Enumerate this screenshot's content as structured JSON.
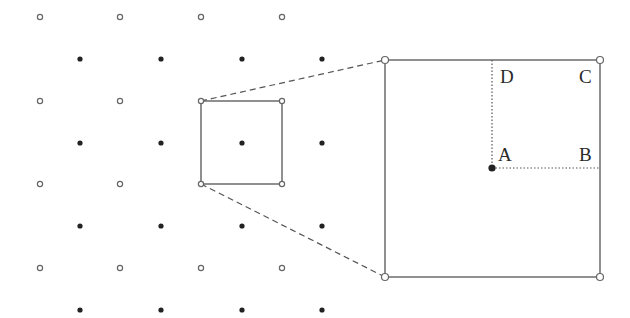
{
  "figure": {
    "colors": {
      "line": "#555555",
      "open_point_stroke": "#666666",
      "filled_point": "#222222",
      "text": "#2a2a2a",
      "background": "#ffffff"
    }
  },
  "lattice": {
    "open_points": {
      "xs": [
        40,
        120,
        201,
        282
      ],
      "ys": [
        17,
        101,
        184,
        268
      ]
    },
    "filled_points": {
      "xs": [
        80,
        161,
        242,
        322
      ],
      "ys": [
        59,
        143,
        226,
        310
      ]
    }
  },
  "small_square": {
    "x1": 201,
    "y1": 101,
    "x2": 282,
    "y2": 184
  },
  "big_square": {
    "x1": 385,
    "y1": 60,
    "x2": 600,
    "y2": 277
  },
  "labels": {
    "A": "A",
    "B": "B",
    "C": "C",
    "D": "D"
  }
}
